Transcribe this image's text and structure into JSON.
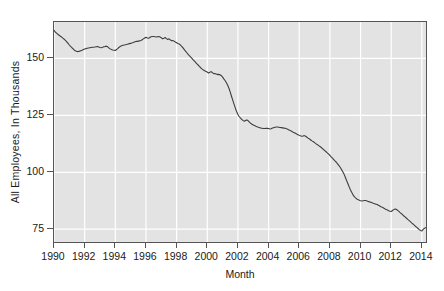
{
  "chart_data": {
    "type": "line",
    "title": "",
    "xlabel": "Month",
    "ylabel": "All Employees, In Thousands",
    "xlim": [
      1990.0,
      2014.4
    ],
    "ylim": [
      68.5,
      166.0
    ],
    "yticks": [
      75,
      100,
      125,
      150
    ],
    "ytick_labels": [
      "75",
      "100",
      "125",
      "150"
    ],
    "xticks": [
      1990,
      1992,
      1994,
      1996,
      1998,
      2000,
      2002,
      2004,
      2006,
      2008,
      2010,
      2012,
      2014
    ],
    "xtick_labels": [
      "1990",
      "1992",
      "1994",
      "1996",
      "1998",
      "2000",
      "2002",
      "2004",
      "2006",
      "2008",
      "2010",
      "2012",
      "2014"
    ],
    "grid": true,
    "grid_color": "#ffffff",
    "plot_background": "#e3e3e3",
    "line_color": "#3d3d3d",
    "legend": null,
    "series": [
      {
        "name": "All Employees",
        "x": [
          1990.0,
          1990.08,
          1990.17,
          1990.25,
          1990.33,
          1990.42,
          1990.5,
          1990.58,
          1990.67,
          1990.75,
          1990.83,
          1990.92,
          1991.0,
          1991.08,
          1991.17,
          1991.25,
          1991.33,
          1991.42,
          1991.5,
          1991.58,
          1991.67,
          1991.75,
          1991.83,
          1991.92,
          1992.0,
          1992.08,
          1992.17,
          1992.25,
          1992.33,
          1992.42,
          1992.5,
          1992.58,
          1992.67,
          1992.75,
          1992.83,
          1992.92,
          1993.0,
          1993.08,
          1993.17,
          1993.25,
          1993.33,
          1993.42,
          1993.5,
          1993.58,
          1993.67,
          1993.75,
          1993.83,
          1993.92,
          1994.0,
          1994.08,
          1994.17,
          1994.25,
          1994.33,
          1994.42,
          1994.5,
          1994.58,
          1994.67,
          1994.75,
          1994.83,
          1994.92,
          1995.0,
          1995.08,
          1995.17,
          1995.25,
          1995.33,
          1995.42,
          1995.5,
          1995.58,
          1995.67,
          1995.75,
          1995.83,
          1995.92,
          1996.0,
          1996.08,
          1996.17,
          1996.25,
          1996.33,
          1996.42,
          1996.5,
          1996.58,
          1996.67,
          1996.75,
          1996.83,
          1996.92,
          1997.0,
          1997.08,
          1997.17,
          1997.25,
          1997.33,
          1997.42,
          1997.5,
          1997.58,
          1997.67,
          1997.75,
          1997.83,
          1997.92,
          1998.0,
          1998.08,
          1998.17,
          1998.25,
          1998.33,
          1998.42,
          1998.5,
          1998.58,
          1998.67,
          1998.75,
          1998.83,
          1998.92,
          1999.0,
          1999.08,
          1999.17,
          1999.25,
          1999.33,
          1999.42,
          1999.5,
          1999.58,
          1999.67,
          1999.75,
          1999.83,
          1999.92,
          2000.0,
          2000.08,
          2000.17,
          2000.25,
          2000.33,
          2000.42,
          2000.5,
          2000.58,
          2000.67,
          2000.75,
          2000.83,
          2000.92,
          2001.0,
          2001.08,
          2001.17,
          2001.25,
          2001.33,
          2001.42,
          2001.5,
          2001.58,
          2001.67,
          2001.75,
          2001.83,
          2001.92,
          2002.0,
          2002.08,
          2002.17,
          2002.25,
          2002.33,
          2002.42,
          2002.5,
          2002.58,
          2002.67,
          2002.75,
          2002.83,
          2002.92,
          2003.0,
          2003.08,
          2003.17,
          2003.25,
          2003.33,
          2003.42,
          2003.5,
          2003.58,
          2003.67,
          2003.75,
          2003.83,
          2003.92,
          2004.0,
          2004.08,
          2004.17,
          2004.25,
          2004.33,
          2004.42,
          2004.5,
          2004.58,
          2004.67,
          2004.75,
          2004.83,
          2004.92,
          2005.0,
          2005.08,
          2005.17,
          2005.25,
          2005.33,
          2005.42,
          2005.5,
          2005.58,
          2005.67,
          2005.75,
          2005.83,
          2005.92,
          2006.0,
          2006.08,
          2006.17,
          2006.25,
          2006.33,
          2006.42,
          2006.5,
          2006.58,
          2006.67,
          2006.75,
          2006.83,
          2006.92,
          2007.0,
          2007.08,
          2007.17,
          2007.25,
          2007.33,
          2007.42,
          2007.5,
          2007.58,
          2007.67,
          2007.75,
          2007.83,
          2007.92,
          2008.0,
          2008.08,
          2008.17,
          2008.25,
          2008.33,
          2008.42,
          2008.5,
          2008.58,
          2008.67,
          2008.75,
          2008.83,
          2008.92,
          2009.0,
          2009.08,
          2009.17,
          2009.25,
          2009.33,
          2009.42,
          2009.5,
          2009.58,
          2009.67,
          2009.75,
          2009.83,
          2009.92,
          2010.0,
          2010.08,
          2010.17,
          2010.25,
          2010.33,
          2010.42,
          2010.5,
          2010.58,
          2010.67,
          2010.75,
          2010.83,
          2010.92,
          2011.0,
          2011.08,
          2011.17,
          2011.25,
          2011.33,
          2011.42,
          2011.5,
          2011.58,
          2011.67,
          2011.75,
          2011.83,
          2011.92,
          2012.0,
          2012.08,
          2012.17,
          2012.25,
          2012.33,
          2012.42,
          2012.5,
          2012.58,
          2012.67,
          2012.75,
          2012.83,
          2012.92,
          2013.0,
          2013.08,
          2013.17,
          2013.25,
          2013.33,
          2013.42,
          2013.5,
          2013.58,
          2013.67,
          2013.75,
          2013.83,
          2013.92,
          2014.0,
          2014.08,
          2014.17,
          2014.25
        ],
        "values": [
          162.3,
          161.6,
          161.1,
          160.6,
          160.2,
          159.7,
          159.4,
          158.9,
          158.4,
          157.9,
          157.3,
          156.6,
          155.9,
          155.3,
          154.7,
          154.2,
          153.6,
          153.3,
          153.1,
          153.0,
          153.2,
          153.4,
          153.6,
          153.9,
          154.1,
          154.3,
          154.5,
          154.6,
          154.7,
          154.8,
          154.9,
          154.9,
          155.0,
          155.1,
          155.2,
          155.0,
          154.8,
          154.7,
          154.9,
          155.1,
          155.2,
          155.4,
          155.1,
          154.6,
          154.2,
          153.9,
          153.7,
          153.6,
          153.5,
          153.9,
          154.4,
          154.9,
          155.3,
          155.6,
          155.8,
          155.9,
          156.0,
          156.2,
          156.3,
          156.5,
          156.6,
          156.8,
          157.0,
          157.2,
          157.4,
          157.5,
          157.6,
          157.7,
          157.9,
          158.2,
          158.6,
          159.0,
          159.3,
          159.0,
          158.9,
          159.2,
          159.5,
          159.6,
          159.6,
          159.5,
          159.4,
          159.5,
          159.6,
          159.4,
          159.1,
          158.6,
          158.9,
          159.2,
          158.7,
          158.3,
          158.6,
          158.2,
          157.8,
          157.9,
          157.6,
          157.2,
          156.9,
          156.6,
          156.3,
          155.9,
          155.3,
          154.6,
          153.9,
          153.2,
          152.5,
          151.8,
          151.2,
          150.6,
          150.0,
          149.4,
          148.8,
          148.2,
          147.6,
          147.0,
          146.4,
          145.8,
          145.3,
          144.9,
          144.6,
          144.3,
          144.0,
          143.6,
          143.9,
          144.2,
          143.8,
          143.3,
          143.4,
          143.2,
          142.9,
          143.0,
          142.8,
          142.4,
          141.8,
          141.0,
          140.2,
          139.3,
          138.2,
          136.8,
          135.2,
          133.4,
          131.5,
          129.8,
          128.2,
          126.6,
          125.4,
          124.5,
          123.8,
          123.2,
          122.8,
          122.4,
          122.7,
          123.0,
          122.6,
          122.0,
          121.5,
          121.1,
          120.8,
          120.5,
          120.2,
          120.0,
          119.8,
          119.6,
          119.4,
          119.3,
          119.2,
          119.2,
          119.3,
          119.3,
          119.2,
          119.0,
          119.1,
          119.4,
          119.6,
          119.8,
          119.9,
          119.9,
          119.8,
          119.7,
          119.6,
          119.5,
          119.4,
          119.3,
          119.1,
          118.9,
          118.6,
          118.3,
          118.0,
          117.7,
          117.4,
          117.1,
          116.8,
          116.5,
          116.2,
          116.0,
          115.8,
          115.9,
          116.1,
          115.8,
          115.4,
          115.0,
          114.6,
          114.2,
          113.8,
          113.4,
          113.0,
          112.6,
          112.2,
          111.8,
          111.4,
          111.0,
          110.5,
          110.0,
          109.5,
          109.0,
          108.5,
          108.0,
          107.4,
          106.8,
          106.2,
          105.6,
          105.0,
          104.4,
          103.7,
          103.0,
          102.2,
          101.3,
          100.3,
          99.2,
          97.9,
          96.5,
          95.1,
          93.7,
          92.4,
          91.2,
          90.2,
          89.4,
          88.8,
          88.3,
          88.0,
          87.7,
          87.5,
          87.4,
          87.5,
          87.6,
          87.6,
          87.4,
          87.2,
          87.0,
          86.8,
          86.6,
          86.4,
          86.2,
          86.0,
          85.8,
          85.5,
          85.2,
          84.9,
          84.6,
          84.3,
          84.0,
          83.7,
          83.4,
          83.1,
          82.9,
          82.8,
          83.2,
          83.6,
          83.9,
          83.7,
          83.3,
          82.8,
          82.3,
          81.8,
          81.3,
          80.8,
          80.3,
          79.8,
          79.3,
          78.8,
          78.3,
          77.8,
          77.3,
          76.8,
          76.3,
          75.8,
          75.3,
          74.8,
          74.4,
          74.2,
          74.9,
          75.4,
          75.6
        ]
      }
    ]
  }
}
